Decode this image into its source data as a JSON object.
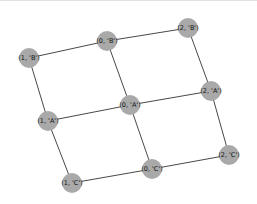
{
  "graph": {
    "node_color": "#a9a9a9",
    "edge_color": "#333333",
    "nodes": [
      {
        "id": "1B",
        "label": "(1, 'B')",
        "x": 29,
        "y": 57
      },
      {
        "id": "0B",
        "label": "(0, 'B')",
        "x": 107,
        "y": 40
      },
      {
        "id": "2B",
        "label": "(2, 'B')",
        "x": 188,
        "y": 27
      },
      {
        "id": "1A",
        "label": "(1, 'A')",
        "x": 48,
        "y": 120
      },
      {
        "id": "0A",
        "label": "(0, 'A')",
        "x": 130,
        "y": 104
      },
      {
        "id": "2A",
        "label": "(2, 'A')",
        "x": 211,
        "y": 90
      },
      {
        "id": "1C",
        "label": "(1, 'C')",
        "x": 72,
        "y": 182
      },
      {
        "id": "0C",
        "label": "(0, 'C')",
        "x": 152,
        "y": 168
      },
      {
        "id": "2C",
        "label": "(2, 'C')",
        "x": 229,
        "y": 154
      }
    ],
    "edges": [
      [
        "1B",
        "0B"
      ],
      [
        "0B",
        "2B"
      ],
      [
        "1A",
        "0A"
      ],
      [
        "0A",
        "2A"
      ],
      [
        "1C",
        "0C"
      ],
      [
        "0C",
        "2C"
      ],
      [
        "1B",
        "1A"
      ],
      [
        "1A",
        "1C"
      ],
      [
        "0B",
        "0A"
      ],
      [
        "0A",
        "0C"
      ],
      [
        "2B",
        "2A"
      ],
      [
        "2A",
        "2C"
      ]
    ]
  }
}
